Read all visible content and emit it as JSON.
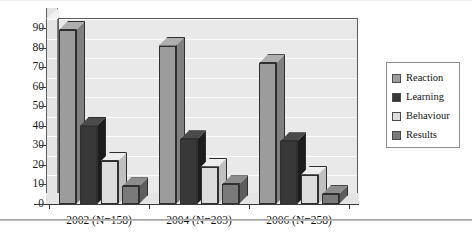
{
  "chart_data": {
    "type": "bar",
    "title": "",
    "subtitle": "",
    "xlabel": "",
    "ylabel": "",
    "categories": [
      "2002 (N=158)",
      "2004 (N=203)",
      "2006 (N=258)"
    ],
    "series": [
      {
        "name": "Reaction",
        "color": "#9c9c9c",
        "values": [
          89,
          81,
          72
        ]
      },
      {
        "name": "Learning",
        "color": "#383838",
        "values": [
          40,
          33,
          32
        ]
      },
      {
        "name": "Behaviour",
        "color": "#dcdcdc",
        "values": [
          22,
          19,
          15
        ]
      },
      {
        "name": "Results",
        "color": "#7a7a7a",
        "values": [
          9,
          10,
          5
        ]
      }
    ],
    "ylim": [
      0,
      90
    ],
    "yticks": [
      0,
      10,
      20,
      30,
      40,
      50,
      60,
      70,
      80,
      90
    ],
    "ytick_labels": [
      "0",
      "10",
      "20",
      "30",
      "40",
      "50",
      "60",
      "70",
      "80",
      "90"
    ],
    "grid": true,
    "legend_position": "right",
    "style": "3d-column",
    "plot_background": "#e9e9e9",
    "gridline_color": "#fbfbfb",
    "axis_color": "#3c3c3c"
  },
  "legend": {
    "items": [
      {
        "label": "Reaction",
        "color": "#9c9c9c"
      },
      {
        "label": "Learning",
        "color": "#383838"
      },
      {
        "label": "Behaviour",
        "color": "#dcdcdc"
      },
      {
        "label": "Results",
        "color": "#7a7a7a"
      }
    ]
  }
}
